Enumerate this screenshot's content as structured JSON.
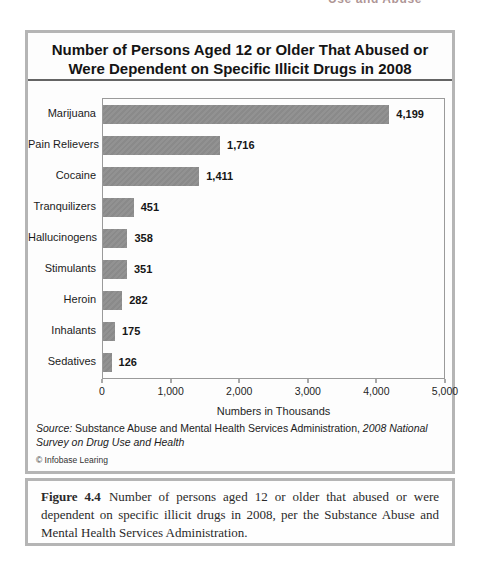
{
  "page": {
    "running_head_fragment": "Use and Abuse"
  },
  "figure": {
    "title": "Number of Persons Aged 12 or Older That Abused or Were Dependent on Specific Illicit Drugs in 2008",
    "source": {
      "label": "Source:",
      "text": " Substance Abuse and Mental Health Services Administration, ",
      "italic": "2008 National Survey on Drug Use and Health"
    },
    "copyright": "© Infobase Learing"
  },
  "chart_data": {
    "type": "bar",
    "orientation": "horizontal",
    "title": "Number of Persons Aged 12 or Older That Abused or Were Dependent on Specific Illicit Drugs in 2008",
    "categories": [
      "Marijuana",
      "Pain Relievers",
      "Cocaine",
      "Tranquilizers",
      "Hallucinogens",
      "Stimulants",
      "Heroin",
      "Inhalants",
      "Sedatives"
    ],
    "values": [
      4199,
      1716,
      1411,
      451,
      358,
      351,
      282,
      175,
      126
    ],
    "value_labels": [
      "4,199",
      "1,716",
      "1,411",
      "451",
      "358",
      "351",
      "282",
      "175",
      "126"
    ],
    "xlabel": "Numbers in Thousands",
    "xlim": [
      0,
      5000
    ],
    "xticks": [
      0,
      1000,
      2000,
      3000,
      4000,
      5000
    ],
    "xtick_labels": [
      "0",
      "1,000",
      "2,000",
      "3,000",
      "4,000",
      "5,000"
    ],
    "bar_color": "#8e8e8e",
    "grid": false,
    "legend": false
  },
  "caption": {
    "label": "Figure 4.4",
    "text": "Number of persons aged 12 or older that abused or were dependent on specific illicit drugs in 2008, per the Substance Abuse and Mental Health Services Administration."
  }
}
